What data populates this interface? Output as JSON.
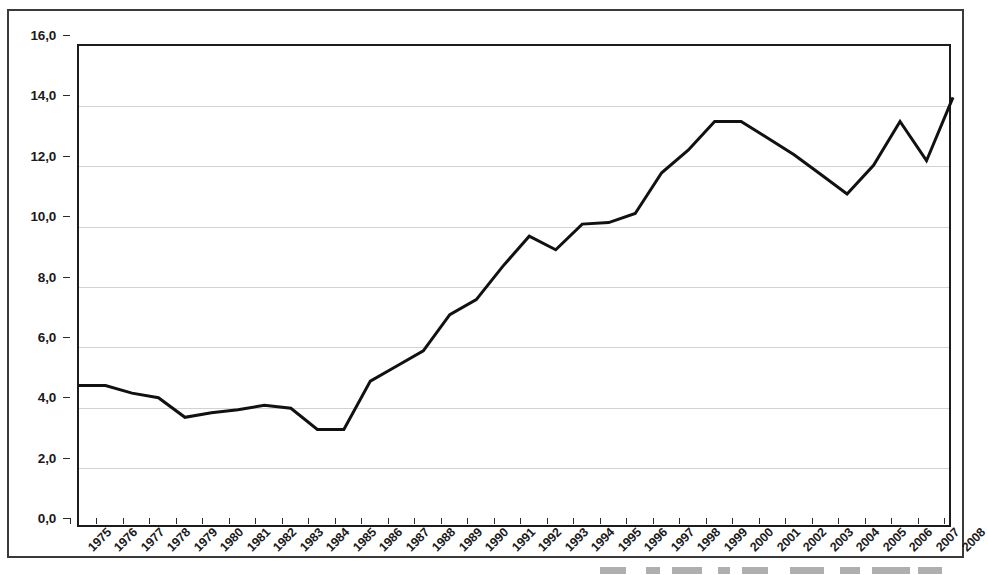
{
  "chart_data": {
    "type": "line",
    "title": "",
    "subtitle": "",
    "xlabel": "",
    "ylabel": "",
    "grid": true,
    "legend": false,
    "legend_position": "none",
    "decimal_separator": ",",
    "line_color": "#111111",
    "line_width_px": 3,
    "ylim": [
      0.0,
      16.0
    ],
    "ytick_step": 2.0,
    "ytick_labels": [
      "0,0",
      "2,0",
      "4,0",
      "6,0",
      "8,0",
      "10,0",
      "12,0",
      "14,0",
      "16,0"
    ],
    "ytick_values": [
      0.0,
      2.0,
      4.0,
      6.0,
      8.0,
      10.0,
      12.0,
      14.0,
      16.0
    ],
    "categories": [
      "1975",
      "1976",
      "1977",
      "1978",
      "1979",
      "1980",
      "1981",
      "1982",
      "1983",
      "1984",
      "1985",
      "1986",
      "1987",
      "1988",
      "1989",
      "1990",
      "1991",
      "1992",
      "1993",
      "1994",
      "1995",
      "1996",
      "1997",
      "1998",
      "1999",
      "2000",
      "2001",
      "2002",
      "2003",
      "2004",
      "2005",
      "2006",
      "2007",
      "2008"
    ],
    "values": [
      4.75,
      4.75,
      4.5,
      4.35,
      3.7,
      3.85,
      3.95,
      4.1,
      4.0,
      3.3,
      3.3,
      4.9,
      5.4,
      5.9,
      7.1,
      7.6,
      8.7,
      9.7,
      9.25,
      10.1,
      10.15,
      10.45,
      11.8,
      12.55,
      13.5,
      13.5,
      12.95,
      12.4,
      11.75,
      11.1,
      12.05,
      13.5,
      12.2,
      14.3
    ],
    "series": [
      {
        "name": "series-1",
        "values": [
          4.75,
          4.75,
          4.5,
          4.35,
          3.7,
          3.85,
          3.95,
          4.1,
          4.0,
          3.3,
          3.3,
          4.9,
          5.4,
          5.9,
          7.1,
          7.6,
          8.7,
          9.7,
          9.25,
          10.1,
          10.15,
          10.45,
          11.8,
          12.55,
          13.5,
          13.5,
          12.95,
          12.4,
          11.75,
          11.1,
          12.05,
          13.5,
          12.2,
          14.3
        ]
      }
    ],
    "annotations": []
  },
  "figure": {
    "border_color": "#3a3a3a",
    "axis_color": "#1c1c1c",
    "gridline_color": "#d2d2d2",
    "background": "#ffffff"
  }
}
